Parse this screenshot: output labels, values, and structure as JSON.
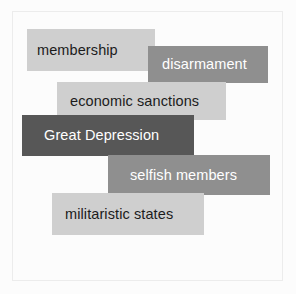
{
  "figure": {
    "background_color": "#fcfcfc",
    "frame_color": "#ececec",
    "palette": {
      "light": "#cfcfcf",
      "mid": "#8f8f8f",
      "dark": "#575757",
      "text_dark": "#1c1c1c",
      "text_light": "#ffffff"
    }
  },
  "boxes": [
    {
      "label": "membership",
      "tone": "light",
      "fill": "#cfcfcf",
      "text_color": "#1c1c1c",
      "x": 27,
      "y": 29,
      "width": 128,
      "height": 42,
      "order": 1
    },
    {
      "label": "disarmament",
      "tone": "mid",
      "fill": "#8f8f8f",
      "text_color": "#ffffff",
      "x": 148,
      "y": 46,
      "width": 120,
      "height": 37,
      "order": 2
    },
    {
      "label": "economic sanctions",
      "tone": "light",
      "fill": "#cfcfcf",
      "text_color": "#1c1c1c",
      "x": 57,
      "y": 82,
      "width": 169,
      "height": 38,
      "order": 3
    },
    {
      "label": "Great Depression",
      "tone": "dark",
      "fill": "#575757",
      "text_color": "#ffffff",
      "x": 22,
      "y": 115,
      "width": 172,
      "height": 41,
      "order": 4
    },
    {
      "label": "selfish members",
      "tone": "mid",
      "fill": "#8f8f8f",
      "text_color": "#ffffff",
      "x": 108,
      "y": 155,
      "width": 162,
      "height": 40,
      "order": 5
    },
    {
      "label": "militaristic states",
      "tone": "light",
      "fill": "#cfcfcf",
      "text_color": "#1c1c1c",
      "x": 52,
      "y": 193,
      "width": 152,
      "height": 42,
      "order": 6
    }
  ]
}
